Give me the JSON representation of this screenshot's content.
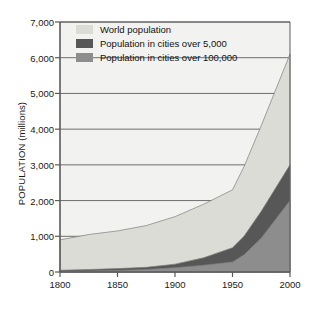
{
  "chart_data": {
    "type": "area",
    "title": "",
    "subtitle": "",
    "xlabel": "",
    "ylabel": "POPULATION  (millions)",
    "xlim": [
      1800,
      2000
    ],
    "ylim": [
      0,
      7000
    ],
    "grid": true,
    "stacked": false,
    "legend_position": "top-left-inside",
    "x_ticks": [
      "1800",
      "1850",
      "1900",
      "1950",
      "2000"
    ],
    "x_tick_values": [
      1800,
      1850,
      1900,
      1950,
      2000
    ],
    "y_ticks": [
      "0",
      "1,000",
      "2,000",
      "3,000",
      "4,000",
      "5,000",
      "6,000",
      "7,000"
    ],
    "y_tick_values": [
      0,
      1000,
      2000,
      3000,
      4000,
      5000,
      6000,
      7000
    ],
    "x": [
      1800,
      1825,
      1850,
      1875,
      1900,
      1925,
      1950,
      1960,
      1975,
      2000
    ],
    "series": [
      {
        "name": "World population",
        "color": "#dcdcd6",
        "values": [
          900,
          1050,
          1150,
          1300,
          1550,
          1900,
          2300,
          2950,
          4100,
          6100
        ]
      },
      {
        "name": "Population in cities over 5,000",
        "color": "#575757",
        "values": [
          50,
          70,
          95,
          130,
          220,
          400,
          680,
          1000,
          1700,
          3000
        ]
      },
      {
        "name": "Population in cities over 100,000",
        "color": "#8d8d8d",
        "values": [
          20,
          30,
          45,
          70,
          120,
          190,
          280,
          480,
          950,
          2000
        ]
      }
    ]
  },
  "legend": {
    "items": [
      {
        "label": "World population",
        "color": "#dcdcd6"
      },
      {
        "label": "Population in cities over 5,000",
        "color": "#575757"
      },
      {
        "label": "Population in cities over 100,000",
        "color": "#8d8d8d"
      }
    ]
  },
  "colors": {
    "plot_background": "#f2f2f0",
    "gridline": "#6e6e6e",
    "axis": "#5a5a5a",
    "text": "#1a1a1a",
    "page_background": "#ffffff"
  }
}
